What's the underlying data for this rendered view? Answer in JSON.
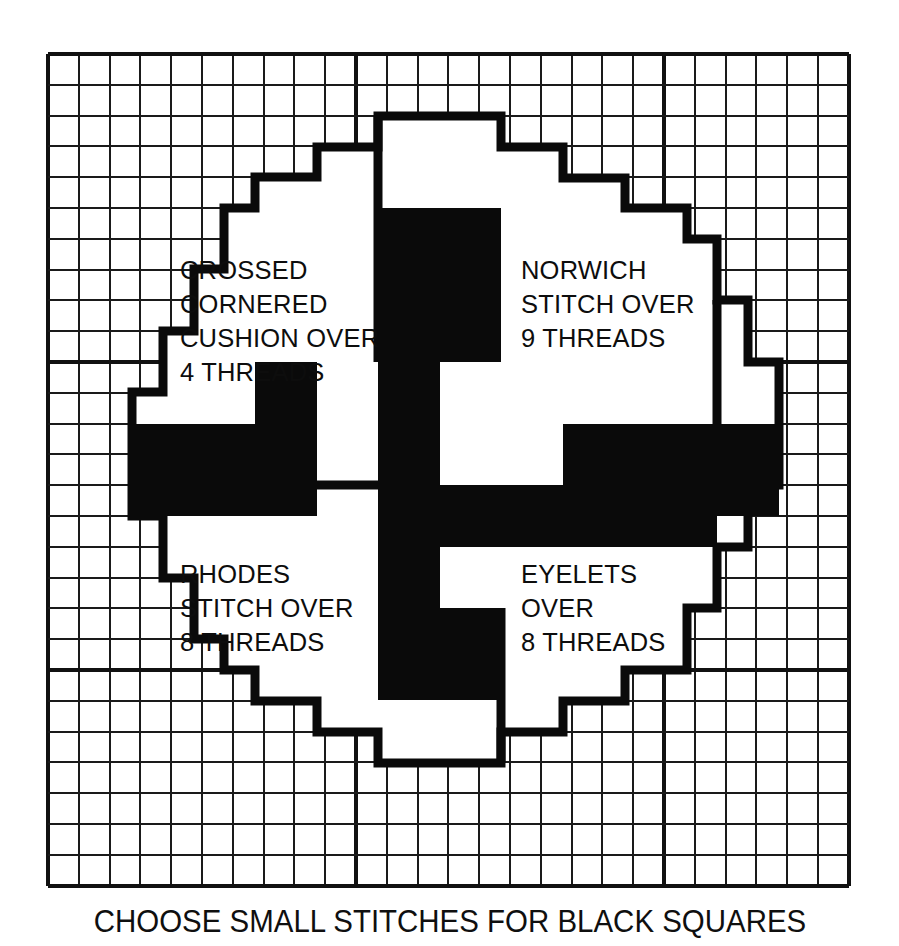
{
  "document": {
    "type": "needlework-stitch-chart",
    "caption": "CHOOSE SMALL STITCHES FOR BLACK SQUARES"
  },
  "grid": {
    "origin_x": 48,
    "origin_y": 54,
    "cell": 30.8,
    "columns": 26,
    "rows": 27,
    "line_color": "#1a1a1a",
    "heavy_every": 10,
    "heavy_columns": [
      10,
      20
    ],
    "heavy_rows": [
      10,
      20
    ]
  },
  "palette": {
    "ink": "#0a0a0a",
    "paper": "#ffffff",
    "grid": "#1a1a1a"
  },
  "quadrant_labels": [
    {
      "id": "crossed-cornered-cushion",
      "lines": [
        "CROSSED",
        "CORNERED",
        "CUSHION OVER",
        "4 THREADS"
      ],
      "x": 180,
      "y": 279
    },
    {
      "id": "norwich-stitch",
      "lines": [
        "NORWICH",
        "STITCH OVER",
        "9 THREADS"
      ],
      "x": 521,
      "y": 279
    },
    {
      "id": "rhodes-stitch",
      "lines": [
        "RHODES",
        "STITCH OVER",
        "8 THREADS"
      ],
      "x": 180,
      "y": 583
    },
    {
      "id": "eyelets",
      "lines": [
        "EYELETS",
        "OVER",
        "8 THREADS"
      ],
      "x": 521,
      "y": 583
    }
  ],
  "octagon_outline_points": "378,116 378,116 501,116 501,147 563,147 563,178 625,178 625,208 687,208 687,239 717,239 717,300 748,300 748,362 779,362 779,485 748,485 748,547 717,547 717,608 687,608 687,670 625,670 625,701 563,701 563,732 501,732 501,763 378,763 378,732 317,732 317,701 255,701 255,670 224,670 224,639 194,639 194,578 163,578 163,516 132,516 132,392 163,392 163,331 194,331 194,269 224,269 224,208 255,208 255,177 317,177 317,147 378,147",
  "black_blocks": [
    {
      "id": "top-center-block",
      "x": 378,
      "y": 208,
      "w": 123,
      "h": 154
    },
    {
      "id": "upper-left-arm",
      "x": 132,
      "y": 424,
      "w": 185,
      "h": 92
    },
    {
      "id": "center-left-stub",
      "x": 255,
      "y": 362,
      "w": 62,
      "h": 62
    },
    {
      "id": "center-vertical-bar",
      "x": 378,
      "y": 362,
      "w": 62,
      "h": 246
    },
    {
      "id": "center-horizontal-bar",
      "x": 378,
      "y": 485,
      "w": 339,
      "h": 62
    },
    {
      "id": "right-upper-block",
      "x": 563,
      "y": 424,
      "w": 216,
      "h": 92
    },
    {
      "id": "bottom-center-block",
      "x": 378,
      "y": 608,
      "w": 123,
      "h": 92
    }
  ],
  "divider_lines": [
    {
      "id": "top-vertical-divider",
      "x1": 378,
      "y1": 116,
      "x2": 378,
      "y2": 362
    },
    {
      "id": "bottom-vertical-divider",
      "x1": 501,
      "y1": 608,
      "x2": 501,
      "y2": 763
    },
    {
      "id": "left-horizontal-divider",
      "x1": 132,
      "y1": 485,
      "x2": 378,
      "y2": 485
    },
    {
      "id": "right-vertical-divider",
      "x1": 717,
      "y1": 300,
      "x2": 717,
      "y2": 485
    }
  ]
}
